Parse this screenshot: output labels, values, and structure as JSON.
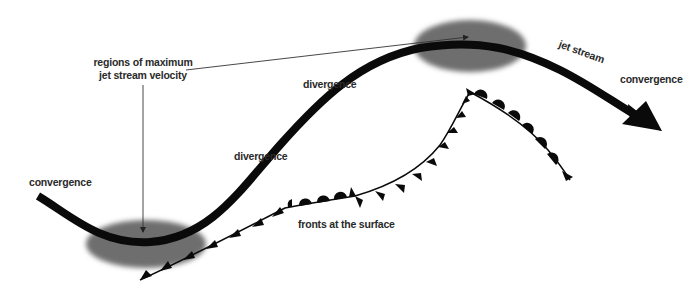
{
  "diagram": {
    "labels": {
      "regions_line1": "regions of maximum",
      "regions_line2": "jet stream velocity",
      "convergence_left": "convergence",
      "divergence_lower": "divergence",
      "divergence_upper": "divergence",
      "jet_stream": "jet stream",
      "convergence_right": "convergence",
      "fronts": "fronts at the surface"
    },
    "colors": {
      "jet_stream": "#0a0a0a",
      "max_velocity_region": "#6e6e6e",
      "front": "#0a0a0a",
      "leader_line": "#333333",
      "text": "#2a2a2a"
    }
  }
}
